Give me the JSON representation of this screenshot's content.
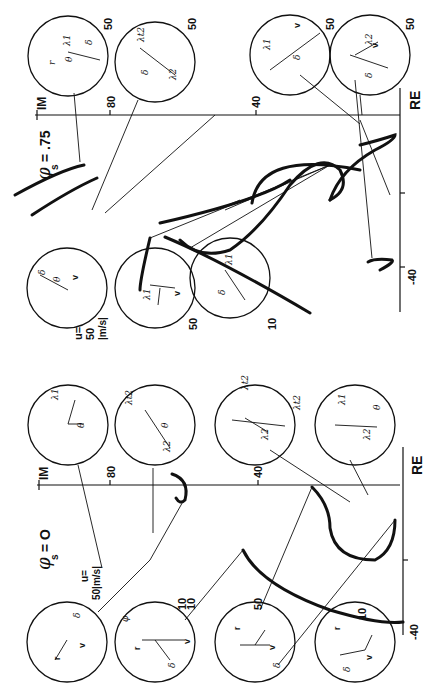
{
  "figure": {
    "orientation": "rotated 90 degrees clockwise",
    "panels": [
      {
        "id": "phi-075",
        "title": "φs = .75",
        "axes": {
          "x_label": "RE",
          "y_label": "IM",
          "re_tick": "-40",
          "im_ticks": [
            "40",
            "80"
          ]
        },
        "speed_label": "u= 50 |m/s|",
        "circle_labels": [
          "50",
          "50",
          "50",
          "50",
          "50",
          "50",
          "10"
        ],
        "phasor_symbols": [
          "r",
          "v",
          "δ",
          "θ",
          "φ",
          "λ1",
          "λ2",
          "λt2"
        ]
      },
      {
        "id": "phi-0",
        "title": "φs = O",
        "axes": {
          "x_label": "RE",
          "y_label": "IM",
          "re_tick": "-40",
          "im_ticks": [
            "40",
            "80"
          ]
        },
        "speed_label": "u= 50 |m/s|",
        "circle_labels": [
          "10",
          "50",
          "10"
        ],
        "phasor_symbols": [
          "r",
          "v",
          "δ",
          "θ",
          "φ",
          "λ1",
          "λ2",
          "λt2"
        ]
      }
    ]
  },
  "labels": {
    "top_title": "φ",
    "top_title_sub": "s",
    "top_title_val": "= .75",
    "bot_title": "φ",
    "bot_title_sub": "s",
    "bot_title_val": "= O",
    "im": "IM",
    "re": "RE",
    "t80": "80",
    "t40": "40",
    "tm40": "-40",
    "u_eq": "u=",
    "u_50": "50",
    "u_unit": "|m/s|",
    "u_bottom": "50|m/s|",
    "n50": "50",
    "n10": "10"
  }
}
